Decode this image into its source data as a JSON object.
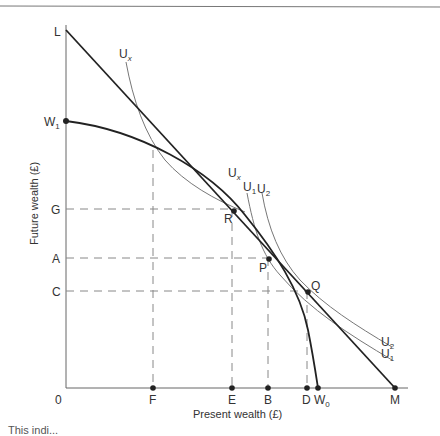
{
  "diagram": {
    "y_axis_label": "Future wealth (£)",
    "x_axis_label": "Present wealth (£)",
    "origin_label": "0",
    "y_labels": {
      "L": "L",
      "W1_main": "W",
      "W1_sub": "1",
      "G": "G",
      "A": "A",
      "C": "C"
    },
    "x_labels": {
      "F": "F",
      "E": "E",
      "B": "B",
      "D": "D",
      "W0_main": "W",
      "W0_sub": "0",
      "M": "M"
    },
    "points": {
      "R": "R",
      "P": "P",
      "Q": "Q"
    },
    "curves": {
      "Ux_top_main": "U",
      "Ux_top_sub": "x",
      "Ux_mid_main": "U",
      "Ux_mid_sub": "x",
      "U1_top_main": "U",
      "U1_top_sub": "1",
      "U2_top_main": "U",
      "U2_top_sub": "2",
      "U2_bot_main": "U",
      "U2_bot_sub": "2",
      "U1_bot_main": "U",
      "U1_bot_sub": "1"
    },
    "caption": "This indi..."
  },
  "colors": {
    "axis": "#555555",
    "curve": "#222222",
    "indifference": "#777777",
    "dashed": "#888888",
    "text": "#333333"
  }
}
